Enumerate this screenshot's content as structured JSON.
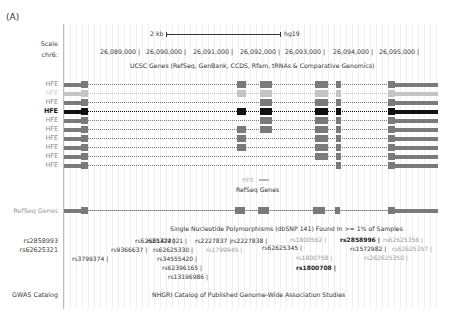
{
  "panel_label": "(A)",
  "left_labels": {
    "scale": "Scale",
    "chrom": "chr6:",
    "refseq": "RefSeq Genes",
    "snp_left_1": "rs2858993",
    "snp_left_2": "rs62625321",
    "gwas": "GWAS Catalog"
  },
  "scale": {
    "size_label": "2 kb",
    "assembly": "hg19"
  },
  "coordinates": [
    "26,089,000 |",
    "26,090,000 |",
    "26,091,000 |",
    "26,092,000 |",
    "26,093,000 |",
    "26,094,000 |",
    "26,095,000 |"
  ],
  "tracks": {
    "ucsc_genes_title": "UCSC Genes (RefSeq, GenBank, CCDS, Rfam, tRNAs & Comparative Genomics)",
    "refseq_small_label": "HFE",
    "refseq_title": "RefSeq Genes",
    "snp_title": "Single Nucleotide Polymorphisms (dbSNP 141) Found In >= 1% of Samples",
    "gwas_title": "NHGRI Catalog of Published Genome-Wide Association Studies"
  },
  "gene_rows": [
    {
      "label": "HFE",
      "color": "#7a7a7a",
      "label_color": "#8a8a8a"
    },
    {
      "label": "HFE",
      "color": "#c4c4c4",
      "label_color": "#d0d0d0"
    },
    {
      "label": "HFE",
      "color": "#7a7a7a",
      "label_color": "#8a8a8a"
    },
    {
      "label": "HFE",
      "color": "#111111",
      "label_color": "#111111"
    },
    {
      "label": "HFE",
      "color": "#7a7a7a",
      "label_color": "#8a8a8a"
    },
    {
      "label": "HFE",
      "color": "#7a7a7a",
      "label_color": "#8a8a8a"
    },
    {
      "label": "HFE",
      "color": "#7a7a7a",
      "label_color": "#8a8a8a"
    },
    {
      "label": "HFE",
      "color": "#7a7a7a",
      "label_color": "#8a8a8a"
    },
    {
      "label": "HFE",
      "color": "#7a7a7a",
      "label_color": "#8a8a8a"
    },
    {
      "label": "HFE",
      "color": "#7a7a7a",
      "label_color": "#8a8a8a"
    }
  ],
  "snps": [
    {
      "id": "rs62625324 |",
      "x": 135,
      "y": 237,
      "style": "normal"
    },
    {
      "id": "rs9366637 |",
      "x": 111,
      "y": 246,
      "style": "normal"
    },
    {
      "id": "rs3799374 |",
      "x": 72,
      "y": 255,
      "style": "normal"
    },
    {
      "id": "rs61472021 |",
      "x": 147,
      "y": 237,
      "style": "normal"
    },
    {
      "id": "rs2227837 |",
      "x": 195,
      "y": 237,
      "style": "normal"
    },
    {
      "id": "rs2227838 |",
      "x": 231,
      "y": 237,
      "style": "normal"
    },
    {
      "id": "rs62625330 |",
      "x": 153,
      "y": 246,
      "style": "normal"
    },
    {
      "id": "rs1799945 |",
      "x": 206,
      "y": 246,
      "style": "gray"
    },
    {
      "id": "rs34555420 |",
      "x": 157,
      "y": 255,
      "style": "normal"
    },
    {
      "id": "rs62396165 |",
      "x": 162,
      "y": 264,
      "style": "normal"
    },
    {
      "id": "rs13196986 |",
      "x": 168,
      "y": 273,
      "style": "normal"
    },
    {
      "id": "rs1800562 |",
      "x": 290,
      "y": 236,
      "style": "gray"
    },
    {
      "id": "rs62625345 |",
      "x": 262,
      "y": 244,
      "style": "normal"
    },
    {
      "id": "rs1800758 |",
      "x": 296,
      "y": 254,
      "style": "gray"
    },
    {
      "id": "rs1800708 |",
      "x": 296,
      "y": 264,
      "style": "bold"
    },
    {
      "id": "rs2858996 |",
      "x": 340,
      "y": 236,
      "style": "bold"
    },
    {
      "id": "rs1572982 |",
      "x": 350,
      "y": 245,
      "style": "normal"
    },
    {
      "id": "rs62625356 |",
      "x": 383,
      "y": 236,
      "style": "gray"
    },
    {
      "id": "rs62625357 |",
      "x": 392,
      "y": 245,
      "style": "gray"
    },
    {
      "id": "rs262625350 |",
      "x": 364,
      "y": 254,
      "style": "gray"
    }
  ],
  "colors": {
    "gene_default": "#7a7a7a",
    "gene_highlight": "#111111",
    "gene_light": "#c4c4c4",
    "grid": "#d8d8e4",
    "separator": "#bdbdbd"
  }
}
